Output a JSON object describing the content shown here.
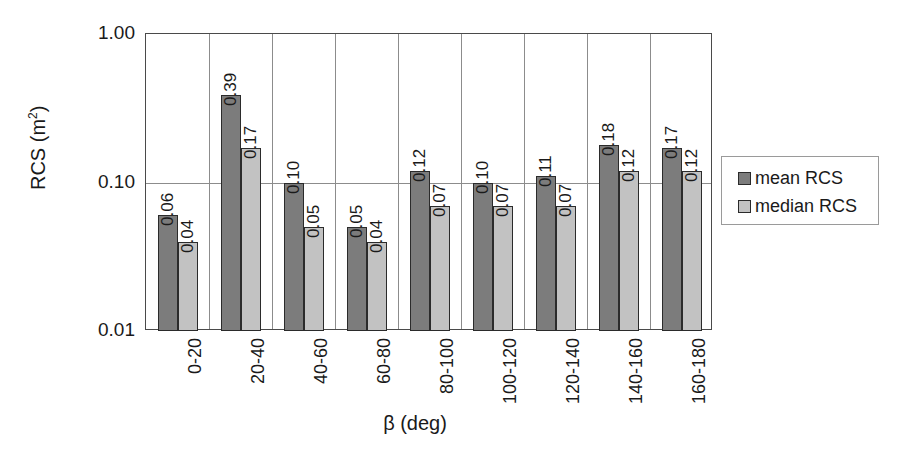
{
  "chart_data": {
    "type": "bar",
    "title": "",
    "xlabel": "β (deg)",
    "ylabel": "RCS (m²)",
    "ylabel_base": "RCS (m",
    "ylabel_sup": "2",
    "ylabel_close": ")",
    "yscale": "log",
    "ylim": [
      0.01,
      1.0
    ],
    "yticks": [
      "1.00",
      "0.10",
      "0.01"
    ],
    "ytick_values": [
      1.0,
      0.1,
      0.01
    ],
    "grid": "horizontal-at-0.10 plus vertical category separators",
    "legend_position": "right-outside",
    "categories": [
      "0-20",
      "20-40",
      "40-60",
      "60-80",
      "80-100",
      "100-120",
      "120-140",
      "140-160",
      "160-180"
    ],
    "series": [
      {
        "name": "mean RCS",
        "color": "#7c7c7c",
        "values": [
          0.06,
          0.39,
          0.1,
          0.05,
          0.12,
          0.1,
          0.11,
          0.18,
          0.17
        ],
        "labels": [
          "0.06",
          "0.39",
          "0.10",
          "0.05",
          "0.12",
          "0.10",
          "0.11",
          "0.18",
          "0.17"
        ]
      },
      {
        "name": "median RCS",
        "color": "#c2c2c2",
        "values": [
          0.04,
          0.17,
          0.05,
          0.04,
          0.07,
          0.07,
          0.07,
          0.12,
          0.12
        ],
        "labels": [
          "0.04",
          "0.17",
          "0.05",
          "0.04",
          "0.07",
          "0.07",
          "0.07",
          "0.12",
          "0.12"
        ]
      }
    ]
  },
  "legend": {
    "items": [
      {
        "label": "mean RCS",
        "swatch": "mean"
      },
      {
        "label": "median RCS",
        "swatch": "median"
      }
    ]
  }
}
